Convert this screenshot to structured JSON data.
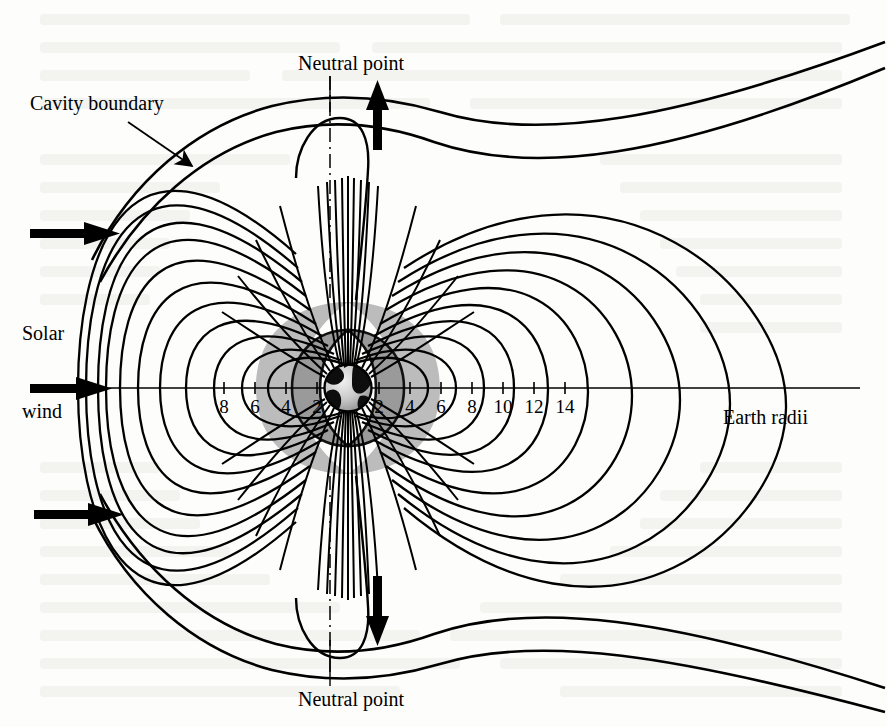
{
  "figure": {
    "kind": "magnetosphere-cross-section",
    "background_color": "#fdfdfb",
    "ink_color": "#000000"
  },
  "labels": {
    "cavity_boundary": "Cavity boundary",
    "neutral_point_top": "Neutral point",
    "neutral_point_bottom": "Neutral point",
    "solar": "Solar",
    "wind": "wind",
    "earth_radii": "Earth radii"
  },
  "axis": {
    "unit": "Earth radii",
    "earth_center_x": 348,
    "earth_center_y": 388,
    "pixels_per_radius": 15.5,
    "line_from_x": 30,
    "line_to_x": 860,
    "left_ticks": [
      8,
      6,
      4,
      2
    ],
    "right_ticks": [
      2,
      4,
      6,
      8,
      10,
      12,
      14
    ],
    "left_tick_labels": [
      "8",
      "6",
      "4",
      "2"
    ],
    "right_tick_labels": [
      "2",
      "4",
      "6",
      "8",
      "10",
      "12",
      "14"
    ]
  },
  "earth": {
    "radius_px": 24,
    "ocean_color": "#cfcfcf",
    "land_color": "#101010",
    "outline_color": "#000000"
  },
  "radiation_belts": [
    {
      "name": "outer-belt",
      "fill": "#bcbcbc",
      "outer_r": 5.6,
      "inner_r": 2.4
    },
    {
      "name": "inner-belt",
      "fill": "#9a9a9a",
      "outer_r": 3.6,
      "inner_r": 1.7
    }
  ],
  "chart_data": {
    "type": "line",
    "xlabel": "Earth radii",
    "ylabel": "",
    "xlim": [
      -10,
      16
    ],
    "grid": false,
    "legend": "none",
    "annotations": [
      {
        "text": "Cavity boundary",
        "x": -8.5,
        "y": 9.2,
        "arrow_to_x": -5.6,
        "arrow_to_y": 7.6
      },
      {
        "text": "Neutral point",
        "x": 0.0,
        "y": 12.0
      },
      {
        "text": "Neutral point",
        "x": 0.0,
        "y": -12.0
      },
      {
        "text": "Solar",
        "x": -10.0,
        "y": 2.2
      },
      {
        "text": "wind",
        "x": -10.0,
        "y": -1.0
      },
      {
        "text": "Earth radii",
        "x": 13.5,
        "y": -1.6
      }
    ],
    "series": [
      {
        "name": "magnetopause-outer",
        "role": "cavity-boundary"
      },
      {
        "name": "magnetopause-inner",
        "role": "cavity-boundary"
      },
      {
        "name": "closed-field-lines-dayside",
        "count": 9
      },
      {
        "name": "closed-field-lines-nightside",
        "count": 9
      },
      {
        "name": "polar-cusp-field-lines",
        "count": 34
      },
      {
        "name": "neutral-point-cusp-north",
        "x": 0,
        "y": 9.5
      },
      {
        "name": "neutral-point-cusp-south",
        "x": 0,
        "y": -9.5
      }
    ],
    "flow_arrows": [
      {
        "name": "solar-wind-arrow-top",
        "x": -11.0,
        "y": 6.8,
        "direction": "right"
      },
      {
        "name": "solar-wind-arrow-middle",
        "x": -11.0,
        "y": 0.0,
        "direction": "right"
      },
      {
        "name": "solar-wind-arrow-bottom",
        "x": -11.0,
        "y": -6.8,
        "direction": "right"
      },
      {
        "name": "neutral-point-arrow-north",
        "x": 1.6,
        "y": 10.5,
        "direction": "up"
      },
      {
        "name": "neutral-point-arrow-south",
        "x": 1.6,
        "y": -10.5,
        "direction": "down"
      }
    ]
  }
}
